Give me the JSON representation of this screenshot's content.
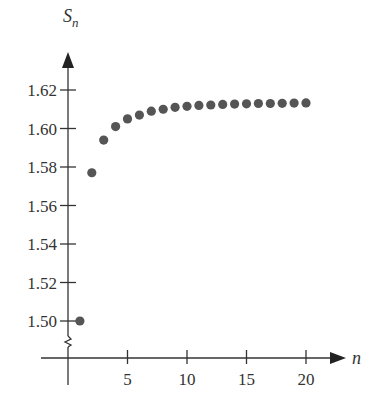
{
  "chart_data": {
    "type": "scatter",
    "title": "",
    "xlabel": "n",
    "ylabel": "S_n",
    "ylabel_main": "S",
    "ylabel_sub": "n",
    "xlim": [
      0,
      21
    ],
    "ylim": [
      1.49,
      1.625
    ],
    "y_axis_break": true,
    "grid": false,
    "legend": null,
    "x_ticks": [
      5,
      10,
      15,
      20
    ],
    "x_tick_labels": [
      "5",
      "10",
      "15",
      "20"
    ],
    "y_ticks": [
      1.5,
      1.52,
      1.54,
      1.56,
      1.58,
      1.6,
      1.62
    ],
    "y_tick_labels": [
      "1.50",
      "1.52",
      "1.54",
      "1.56",
      "1.58",
      "1.60",
      "1.62"
    ],
    "x": [
      1,
      2,
      3,
      4,
      5,
      6,
      7,
      8,
      9,
      10,
      11,
      12,
      13,
      14,
      15,
      16,
      17,
      18,
      19,
      20
    ],
    "values": [
      1.5,
      1.577,
      1.594,
      1.601,
      1.605,
      1.607,
      1.609,
      1.61,
      1.611,
      1.6115,
      1.612,
      1.6122,
      1.6125,
      1.6127,
      1.6128,
      1.613,
      1.613,
      1.6131,
      1.6132,
      1.6133
    ],
    "point_color": "#555555",
    "axis_color": "#333333"
  }
}
